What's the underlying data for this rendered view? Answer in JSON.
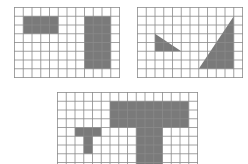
{
  "colors": {
    "grid_line": "#8a8a8a",
    "fill": "#7a7a7a",
    "background": "#ffffff"
  },
  "grids": [
    {
      "id": "grid-1",
      "left": 14,
      "top": 7,
      "cols": 12,
      "rows": 8,
      "cell": 8.75,
      "shapes": [
        {
          "name": "horizontal-rectangle",
          "type": "rect",
          "x": 1,
          "y": 1,
          "w": 4,
          "h": 2
        },
        {
          "name": "vertical-rectangle",
          "type": "rect",
          "x": 8,
          "y": 1,
          "w": 3,
          "h": 6
        }
      ]
    },
    {
      "id": "grid-2",
      "left": 137,
      "top": 7,
      "cols": 12,
      "rows": 8,
      "cell": 8.75,
      "shapes": [
        {
          "name": "small-triangle",
          "type": "poly",
          "points": [
            [
              2,
              3
            ],
            [
              2,
              5
            ],
            [
              5,
              5
            ]
          ]
        },
        {
          "name": "large-triangle",
          "type": "poly",
          "points": [
            [
              7,
              7
            ],
            [
              11,
              1
            ],
            [
              11,
              7
            ]
          ]
        }
      ]
    },
    {
      "id": "grid-3",
      "left": 57,
      "top": 92,
      "cols": 16,
      "rows": 9,
      "cell": 8.75,
      "shapes": [
        {
          "name": "large-t-shape",
          "type": "poly",
          "points": [
            [
              6,
              1
            ],
            [
              15,
              1
            ],
            [
              15,
              4
            ],
            [
              12,
              4
            ],
            [
              12,
              9
            ],
            [
              9,
              9
            ],
            [
              9,
              4
            ],
            [
              6,
              4
            ]
          ]
        },
        {
          "name": "small-t-shape",
          "type": "poly",
          "points": [
            [
              2,
              4
            ],
            [
              5,
              4
            ],
            [
              5,
              5
            ],
            [
              4,
              5
            ],
            [
              4,
              7
            ],
            [
              3,
              7
            ],
            [
              3,
              5
            ],
            [
              2,
              5
            ]
          ]
        }
      ]
    }
  ]
}
